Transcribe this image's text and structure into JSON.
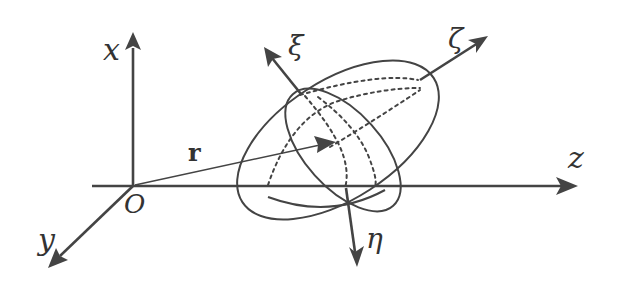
{
  "figure": {
    "type": "body-frame-diagram",
    "lab_axes": {
      "x": "x",
      "y": "y",
      "z": "z",
      "origin": "O"
    },
    "position_vector": "r",
    "body_axes": {
      "xi": "ξ",
      "eta": "η",
      "zeta": "ζ"
    },
    "colors": {
      "stroke": "#444444",
      "background": "#ffffff"
    }
  }
}
